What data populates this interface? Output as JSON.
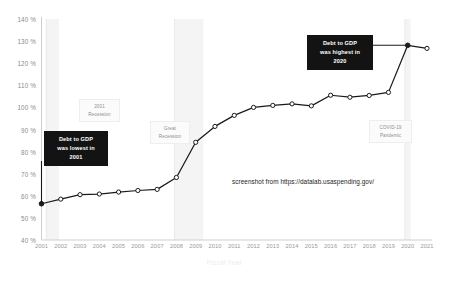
{
  "chart_data": {
    "type": "line",
    "title": "",
    "xlabel": "Fiscal Year",
    "ylabel": "",
    "x": [
      2001,
      2002,
      2003,
      2004,
      2005,
      2006,
      2007,
      2008,
      2009,
      2010,
      2011,
      2012,
      2013,
      2014,
      2015,
      2016,
      2017,
      2018,
      2019,
      2020,
      2021
    ],
    "categories": [
      "2001",
      "2002",
      "2003",
      "2004",
      "2005",
      "2006",
      "2007",
      "2008",
      "2009",
      "2010",
      "2011",
      "2012",
      "2013",
      "2014",
      "2015",
      "2016",
      "2017",
      "2018",
      "2019",
      "2020",
      "2021"
    ],
    "values": [
      56.4,
      58.5,
      60.5,
      60.8,
      61.7,
      62.4,
      62.9,
      68.3,
      84.2,
      91.4,
      96.4,
      100.0,
      100.9,
      101.6,
      100.7,
      105.5,
      104.6,
      105.4,
      106.8,
      128.1,
      126.7
    ],
    "series": [
      {
        "name": "Debt to GDP",
        "values": [
          56.4,
          58.5,
          60.5,
          60.8,
          61.7,
          62.4,
          62.9,
          68.3,
          84.2,
          91.4,
          96.4,
          100.0,
          100.9,
          101.6,
          100.7,
          105.5,
          104.6,
          105.4,
          106.8,
          128.1,
          126.7
        ]
      }
    ],
    "ylim": [
      40,
      140
    ],
    "xlim": [
      2001,
      2021
    ],
    "ytick_values": [
      40,
      50,
      60,
      70,
      80,
      90,
      100,
      110,
      120,
      130,
      140
    ],
    "ytick_labels": [
      "40 %",
      "50 %",
      "60 %",
      "70 %",
      "80 %",
      "90 %",
      "100 %",
      "110 %",
      "120 %",
      "130 %",
      "140 %"
    ],
    "grid": false,
    "legend": "none",
    "highlighted_points": [
      {
        "x": 2001,
        "y": 56.4,
        "style": "filled-black"
      },
      {
        "x": 2020,
        "y": 128.1,
        "style": "filled-black"
      }
    ],
    "marker_style": "open-circle-white-fill",
    "line_color": "#1a1a1a",
    "shaded_bands": [
      {
        "label": "2001 Recession",
        "x_start": 2001.25,
        "x_end": 2001.9
      },
      {
        "label": "Great Recession",
        "x_start": 2007.9,
        "x_end": 2009.4
      },
      {
        "label": "COVID-19 Pandemic",
        "x_start": 2019.85,
        "x_end": 2020.15
      }
    ],
    "annotations": [
      {
        "name": "lowest-callout",
        "lines": [
          "Debt to GDP",
          "was lowest in",
          "2001"
        ],
        "points_to": {
          "x": 2001,
          "y": 56.4
        },
        "style": "black-box"
      },
      {
        "name": "highest-callout",
        "lines": [
          "Debt to GDP",
          "was highest in",
          "2020"
        ],
        "points_to": {
          "x": 2020,
          "y": 128.1
        },
        "style": "black-box"
      },
      {
        "name": "recession-2001-label",
        "lines": [
          "2001",
          "Recession"
        ],
        "style": "gray-box"
      },
      {
        "name": "great-recession-label",
        "lines": [
          "Great",
          "Recession"
        ],
        "style": "gray-box"
      },
      {
        "name": "covid-label",
        "lines": [
          "COVID-19",
          "Pandemic"
        ],
        "style": "gray-box"
      }
    ],
    "source_note": "screenshot from https://datalab.usaspending.gov/",
    "colors": {
      "line": "#1a1a1a",
      "callout_bg": "#131313",
      "callout_text": "#ffffff",
      "band_fill": "#f4f4f4",
      "axis_text": "#8f8f8f",
      "axis_line": "#cfcfcf",
      "note_text": "#1d1d1d"
    }
  },
  "axis": {
    "x_title": "Fiscal Year"
  },
  "callouts": {
    "lowest": {
      "l1": "Debt to GDP",
      "l2": "was lowest in",
      "l3": "2001"
    },
    "highest": {
      "l1": "Debt to GDP",
      "l2": "was highest in",
      "l3": "2020"
    }
  },
  "bands": {
    "recession2001": {
      "l1": "2001",
      "l2": "Recession"
    },
    "greatRecession": {
      "l1": "Great",
      "l2": "Recession"
    },
    "covid": {
      "l1": "COVID-19",
      "l2": "Pandemic"
    }
  },
  "note": {
    "source": "screenshot from https://datalab.usaspending.gov/"
  }
}
